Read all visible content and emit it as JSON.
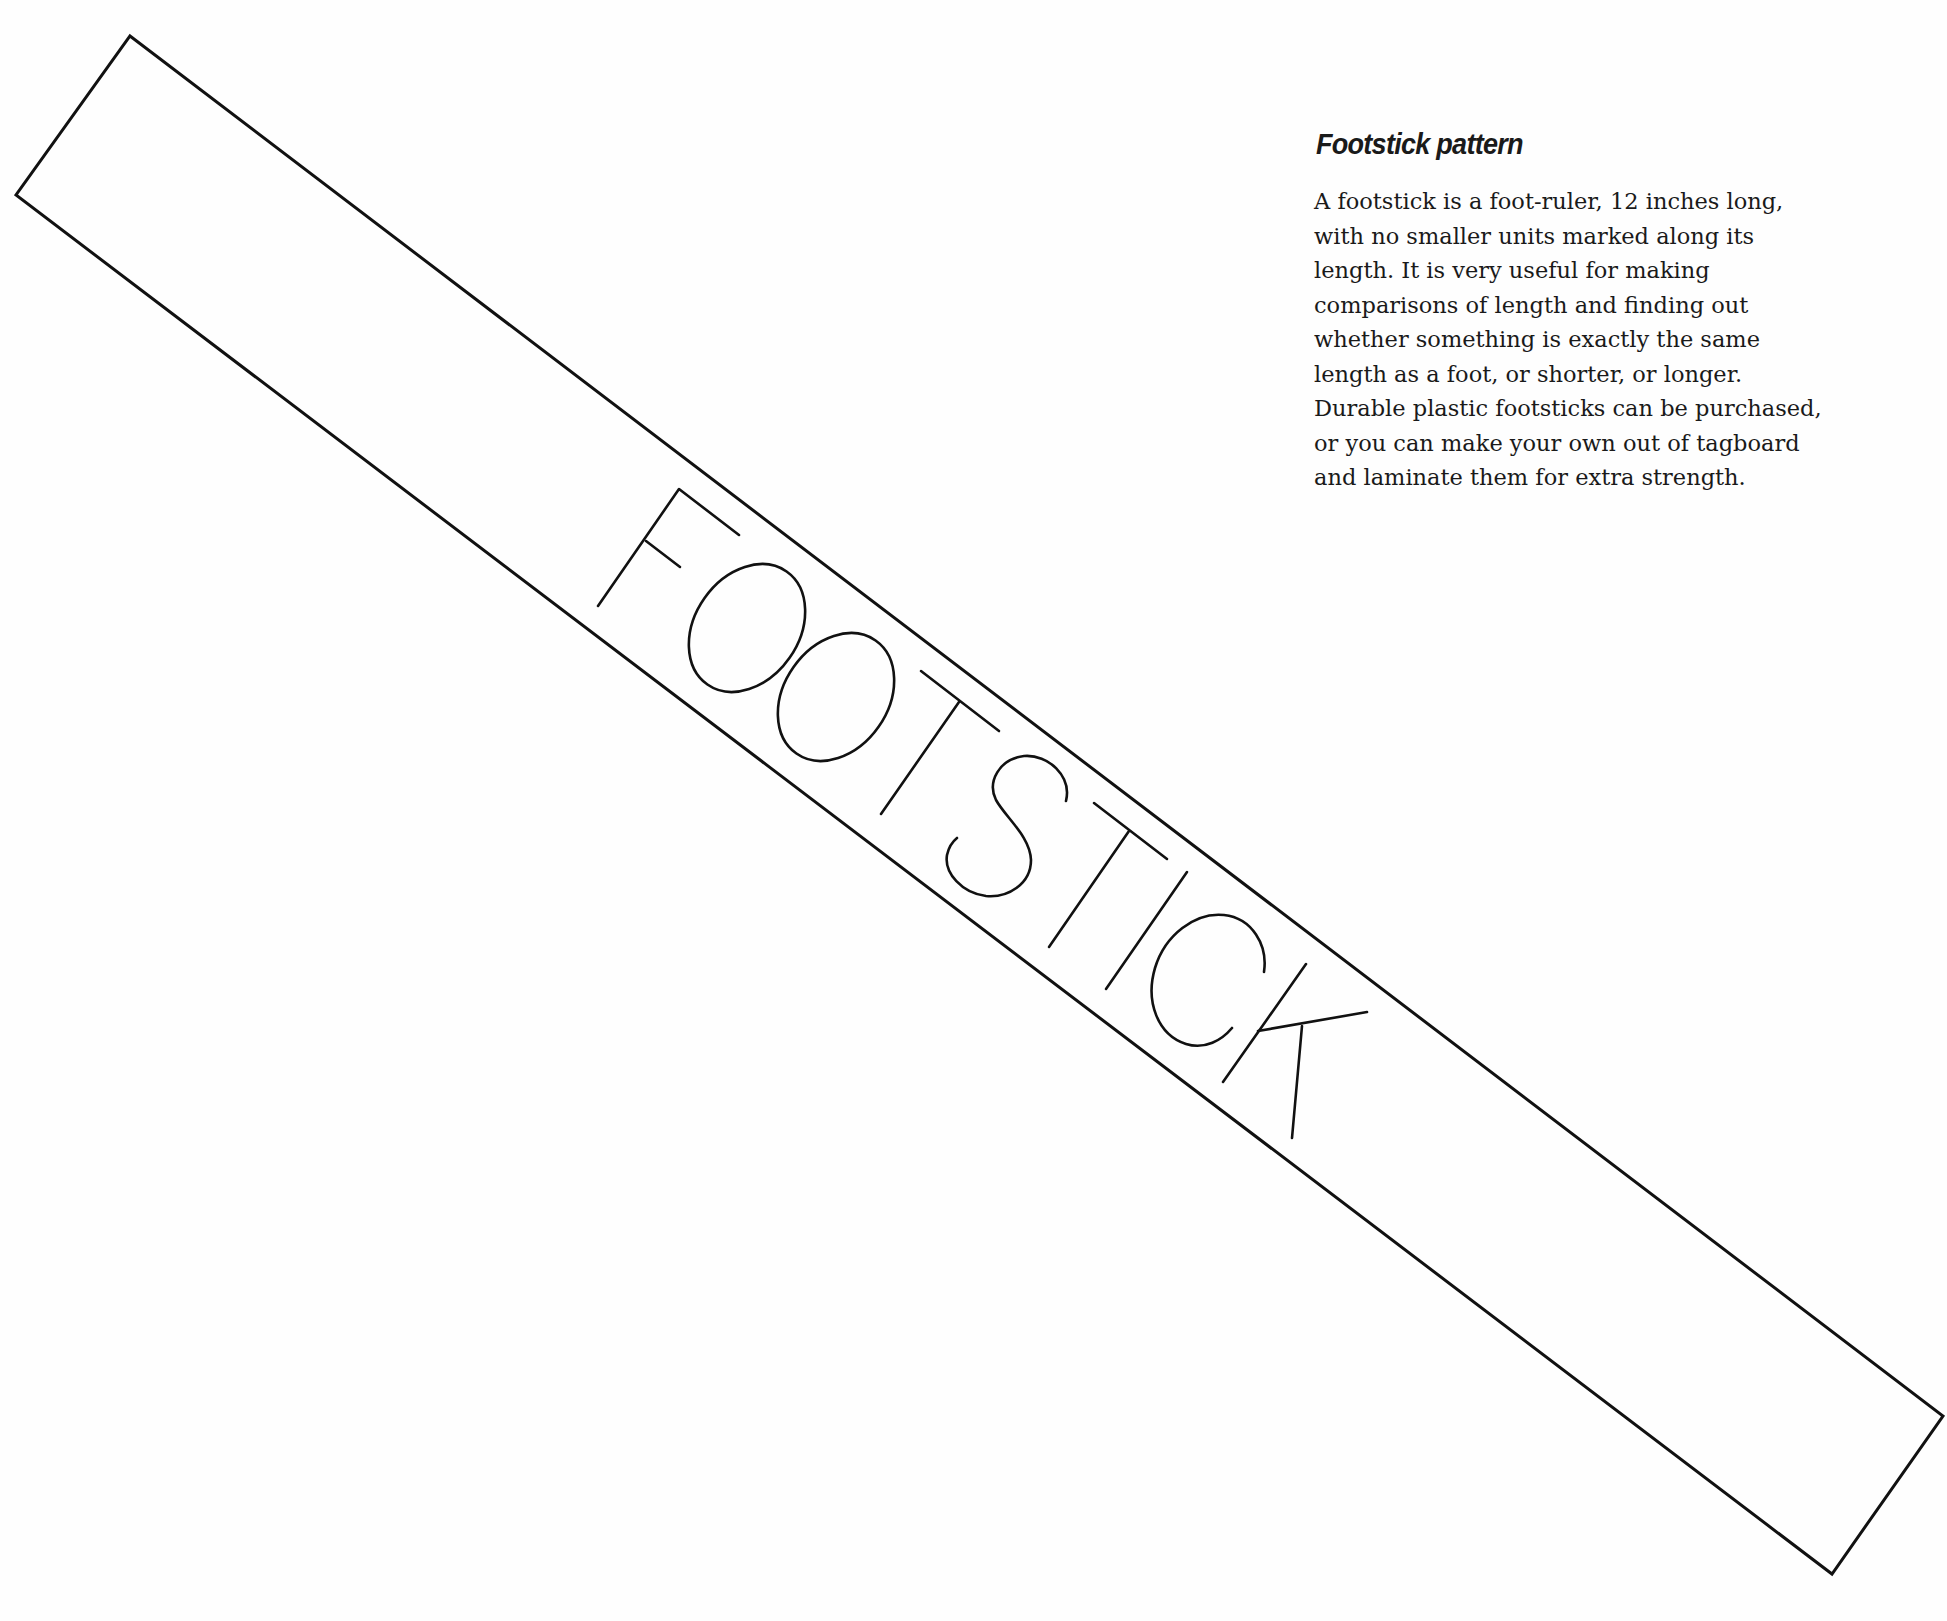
{
  "heading": {
    "title": "Footstick pattern"
  },
  "description": {
    "lines": [
      "A footstick is a foot-ruler, 12 inches long,",
      "with no smaller units marked along its",
      "length. It is very useful for making",
      "comparisons of length and finding out",
      "whether something is exactly the same",
      "length as a foot, or shorter, or longer.",
      "Durable plastic footsticks can be purchased,",
      "or you can make your own out of tagboard",
      "and laminate them for extra strength."
    ]
  },
  "pattern": {
    "label": "FOOTSTICK",
    "letters": [
      "F",
      "O",
      "O",
      "T",
      "S",
      "T",
      "I",
      "C",
      "K"
    ],
    "stroke_color": "#111111",
    "background_color": "#fefefe"
  }
}
